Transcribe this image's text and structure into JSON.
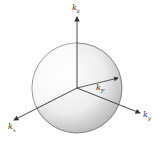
{
  "diagram": {
    "title": "",
    "colors": {
      "stroke": "#444444",
      "sphere_shading": "#9a9a9a",
      "background": "#ffffff"
    },
    "sphere": {
      "cx": 77,
      "cy": 88,
      "r": 45
    },
    "axes": [
      {
        "id": "kz",
        "label": "k",
        "sub": "z",
        "to": [
          77,
          17
        ]
      },
      {
        "id": "kx",
        "label": "k",
        "sub": "x",
        "to": [
          14,
          120
        ]
      },
      {
        "id": "ky",
        "label": "k",
        "sub": "y",
        "to": [
          140,
          113
        ]
      }
    ],
    "vector": {
      "id": "kF",
      "label": "k",
      "sub": "F",
      "to": [
        118,
        78
      ]
    },
    "origin": [
      77,
      88
    ]
  }
}
